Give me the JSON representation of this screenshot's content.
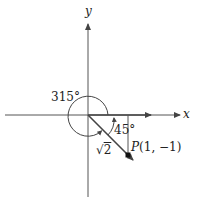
{
  "diagram": {
    "axes": {
      "x_label": "x",
      "y_label": "y"
    },
    "angles": {
      "large_angle": "315°",
      "reference_angle": "45°"
    },
    "vector": {
      "length_label_radical": "√",
      "length_label_value": "2"
    },
    "point": {
      "name": "P",
      "coords": "(1, −1)"
    },
    "colors": {
      "stroke": "#444444",
      "text": "#222222",
      "point": "#111111"
    }
  }
}
